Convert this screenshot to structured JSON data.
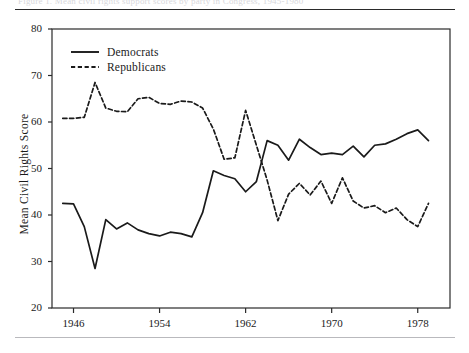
{
  "figure": {
    "caption_ghost": "Figure 1.  Mean civil rights support scores by party in Congress, 1945-1980",
    "rule_top": true,
    "rule_bottom": true
  },
  "chart_data": {
    "type": "line",
    "title": "",
    "xlabel": "",
    "ylabel": "Mean Civil Rights Score",
    "xlim": [
      1944,
      1981
    ],
    "ylim": [
      20,
      80
    ],
    "ytick_values": [
      20,
      30,
      40,
      50,
      60,
      70,
      80
    ],
    "ytick_labels": [
      "20",
      "30",
      "40",
      "50",
      "60",
      "70",
      "80"
    ],
    "xtick_values": [
      1946,
      1954,
      1962,
      1970,
      1978
    ],
    "xtick_labels": [
      "1946",
      "1954",
      "1962",
      "1970",
      "1978"
    ],
    "grid": false,
    "legend_position": "top-left",
    "line_color": "#1a1a1a",
    "series": [
      {
        "name": "Democrats",
        "style": "solid",
        "x": [
          1945,
          1946,
          1947,
          1948,
          1949,
          1950,
          1951,
          1952,
          1953,
          1954,
          1955,
          1956,
          1957,
          1958,
          1959,
          1960,
          1961,
          1962,
          1963,
          1964,
          1965,
          1966,
          1967,
          1968,
          1969,
          1970,
          1971,
          1972,
          1973,
          1974,
          1975,
          1976,
          1977,
          1978,
          1979
        ],
        "values": [
          42.5,
          42.4,
          37.5,
          28.5,
          39.0,
          37.0,
          38.3,
          36.8,
          36.0,
          35.5,
          36.3,
          36.0,
          35.3,
          40.5,
          49.5,
          48.5,
          47.8,
          45.0,
          47.2,
          56.0,
          55.0,
          51.8,
          56.3,
          54.5,
          53.0,
          53.3,
          53.0,
          54.8,
          52.5,
          55.0,
          55.3,
          56.3,
          57.5,
          58.3,
          56.0
        ]
      },
      {
        "name": "Republicans",
        "style": "dashed",
        "x": [
          1945,
          1946,
          1947,
          1948,
          1949,
          1950,
          1951,
          1952,
          1953,
          1954,
          1955,
          1956,
          1957,
          1958,
          1959,
          1960,
          1961,
          1962,
          1963,
          1964,
          1965,
          1966,
          1967,
          1968,
          1969,
          1970,
          1971,
          1972,
          1973,
          1974,
          1975,
          1976,
          1977,
          1978,
          1979
        ],
        "values": [
          60.8,
          60.8,
          61.0,
          68.5,
          63.0,
          62.3,
          62.2,
          65.0,
          65.3,
          64.0,
          63.8,
          64.5,
          64.3,
          63.0,
          58.5,
          52.0,
          52.3,
          62.5,
          55.0,
          47.5,
          38.8,
          44.5,
          46.8,
          44.3,
          47.3,
          42.5,
          48.0,
          43.0,
          41.5,
          42.0,
          40.5,
          41.5,
          39.0,
          37.5,
          42.5
        ]
      }
    ]
  },
  "legend": {
    "items": [
      {
        "label": "Democrats",
        "style": "solid"
      },
      {
        "label": "Republicans",
        "style": "dashed"
      }
    ]
  }
}
